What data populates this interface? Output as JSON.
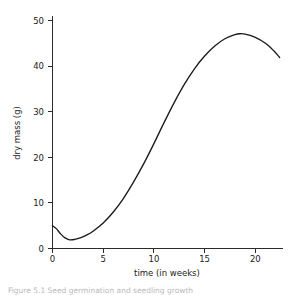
{
  "figure": {
    "caption": "Figure 5.1  Seed germination and seedling growth"
  },
  "chart_data": {
    "type": "line",
    "title": "",
    "subtitle": "",
    "xlabel": "time (in weeks)",
    "ylabel": "dry mass (g)",
    "xlim": [
      0,
      22.6
    ],
    "ylim": [
      0,
      52
    ],
    "xticks": [
      0,
      5,
      10,
      15,
      20
    ],
    "yticks": [
      0,
      10,
      20,
      30,
      40,
      50
    ],
    "xtick_labels": [
      "0",
      "5",
      "10",
      "15",
      "20"
    ],
    "ytick_labels": [
      "0",
      "10",
      "20",
      "30",
      "40",
      "50"
    ],
    "grid": false,
    "legend": false,
    "legend_position": "none",
    "line_color": "#1a1a1a",
    "axis_color": "#2b2b2b",
    "series": [
      {
        "name": "dry mass",
        "x": [
          0.0,
          0.4,
          0.8,
          1.2,
          1.7,
          2.2,
          2.8,
          3.4,
          4.0,
          5.0,
          6.0,
          7.0,
          8.0,
          9.0,
          10.0,
          11.0,
          12.0,
          13.0,
          14.0,
          15.0,
          16.0,
          17.0,
          18.0,
          18.5,
          19.0,
          20.0,
          21.0,
          21.8,
          22.4
        ],
        "y": [
          5.0,
          4.3,
          3.2,
          2.4,
          1.9,
          2.0,
          2.4,
          3.0,
          3.8,
          5.6,
          8.0,
          11.0,
          14.6,
          18.6,
          23.0,
          27.6,
          32.0,
          36.0,
          39.4,
          42.2,
          44.4,
          46.0,
          46.9,
          47.1,
          47.0,
          46.3,
          45.0,
          43.4,
          41.9
        ]
      }
    ],
    "annotations": [
      {
        "label": "initial dry mass",
        "x": 0.0,
        "y": 5.0
      },
      {
        "label": "minimum",
        "x": 1.7,
        "y": 1.9
      },
      {
        "label": "peak dry mass",
        "x": 18.5,
        "y": 47.1
      },
      {
        "label": "final dry mass",
        "x": 22.4,
        "y": 41.9
      }
    ]
  }
}
